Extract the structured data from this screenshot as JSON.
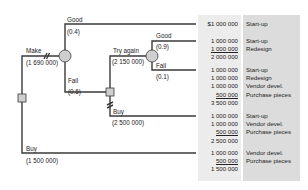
{
  "tree": {
    "root_decision": {
      "type": "decision"
    },
    "branches": {
      "make": {
        "label": "Make",
        "value": "(1 690 000)"
      },
      "good_1": {
        "label": "Good",
        "prob": "(0.4)"
      },
      "fail_1": {
        "label": "Fail",
        "prob": "(0.6)"
      },
      "try_again": {
        "label": "Try again",
        "value": "(2 150 000)"
      },
      "good_2": {
        "label": "Good",
        "prob": "(0.9)"
      },
      "fail_2": {
        "label": "Fail",
        "prob": "(0.1)"
      },
      "buy_2": {
        "label": "Buy",
        "value": "(2 500 000)"
      },
      "buy_1": {
        "label": "Buy",
        "value": "(1 500 000)"
      }
    }
  },
  "outcomes": [
    {
      "amounts": [
        "$1 000 000"
      ],
      "total": "",
      "labels": [
        "Start-up"
      ]
    },
    {
      "amounts": [
        "1 000 000",
        "1 000 000"
      ],
      "total": "2 000 000",
      "labels": [
        "Start-up",
        "Redesign"
      ]
    },
    {
      "amounts": [
        "1 000 000",
        "1 000 000",
        "1 000 000",
        "500 000"
      ],
      "total": "3 500 000",
      "labels": [
        "Start-up",
        "Redesign",
        "Vendor devel.",
        "Purchase pieces"
      ]
    },
    {
      "amounts": [
        "1 000 000",
        "1 000 000",
        "500 000"
      ],
      "total": "2 500 000",
      "labels": [
        "Start-up",
        "Vendor devel.",
        "Purchase pieces"
      ]
    },
    {
      "amounts": [
        "1 000 000",
        "500 000"
      ],
      "total": "1 500 000",
      "labels": [
        "Vendor devel.",
        "Purchase pieces"
      ]
    }
  ],
  "colors": {
    "line": "#3a3a3a",
    "node_fill": "#cfcfcf",
    "panel_amount": "#ececec",
    "panel_label": "#dcdcdc"
  }
}
